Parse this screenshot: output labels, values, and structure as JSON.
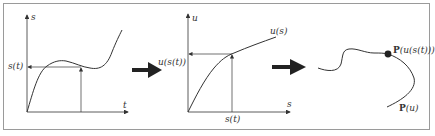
{
  "figure": {
    "colors": {
      "frame": "#9a9a9a",
      "lines": "#333333",
      "arrow": "#222222"
    }
  },
  "panel1": {
    "y_axis_label": "s",
    "x_axis_label": "t",
    "value_label": "s(t)"
  },
  "panel2": {
    "y_axis_label": "u",
    "x_axis_label": "s",
    "value_label": "u(s(t))",
    "curve_label": "u(s)",
    "input_label": "s(t)"
  },
  "panel3": {
    "point_label_prefix": "P",
    "point_label_suffix": "(u(s(t)))",
    "curve_label_prefix": "P",
    "curve_label_suffix": "(u)"
  },
  "arrows": [
    {
      "from": "panel1",
      "to": "panel2"
    },
    {
      "from": "panel2",
      "to": "panel3"
    }
  ]
}
